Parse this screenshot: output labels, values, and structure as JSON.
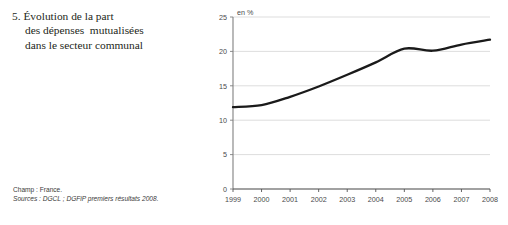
{
  "title": {
    "number": "5.",
    "line1": "5. Évolution de la part",
    "line2": "des dépenses  mutualisées",
    "line3": "dans le secteur communal"
  },
  "footnotes": {
    "champ": "Champ : France.",
    "sources": "Sources : DGCL ; DGFiP premiers résultats 2008."
  },
  "chart_data": {
    "type": "line",
    "title": "5. Évolution de la part des dépenses mutualisées dans le secteur communal",
    "unit_label": "en %",
    "xlabel": "",
    "ylabel": "",
    "categories": [
      "1999",
      "2000",
      "2001",
      "2002",
      "2003",
      "2004",
      "2005",
      "2006",
      "2007",
      "2008"
    ],
    "x": [
      1999,
      2000,
      2001,
      2002,
      2003,
      2004,
      2005,
      2006,
      2007,
      2008
    ],
    "values": [
      11.9,
      12.2,
      13.4,
      14.9,
      16.6,
      18.4,
      20.4,
      20.1,
      21.0,
      21.7
    ],
    "series": [
      {
        "name": "Part des dépenses mutualisées",
        "values": [
          11.9,
          12.2,
          13.4,
          14.9,
          16.6,
          18.4,
          20.4,
          20.1,
          21.0,
          21.7
        ]
      }
    ],
    "ylim": [
      0,
      25
    ],
    "yticks": [
      0,
      5,
      10,
      15,
      20,
      25
    ],
    "ytick_labels": [
      "0",
      "5",
      "10",
      "15",
      "20",
      "25"
    ],
    "xtick_labels": [
      "1999",
      "2000",
      "2001",
      "2002",
      "2003",
      "2004",
      "2005",
      "2006",
      "2007",
      "2008"
    ],
    "xlim": [
      1999,
      2008
    ],
    "grid": true,
    "grid_axis": "y",
    "legend": false,
    "legend_position": "none",
    "line_color": "#1a1a1a",
    "grid_color": "#d9d9d9",
    "axis_color": "#808080",
    "background": "#ffffff"
  }
}
